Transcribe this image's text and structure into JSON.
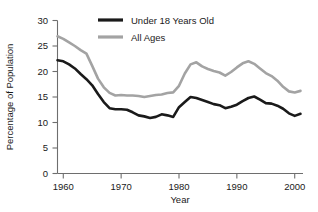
{
  "chart_data": {
    "type": "line",
    "title": "",
    "xlabel": "Year",
    "ylabel": "Percentage of Population",
    "xlim": [
      1959,
      2001
    ],
    "ylim": [
      0,
      30
    ],
    "grid": false,
    "legend_position": "top-center",
    "xticks": [
      "1960",
      "1970",
      "1980",
      "1990",
      "2000"
    ],
    "xtick_values": [
      1960,
      1970,
      1980,
      1990,
      2000
    ],
    "yticks": [
      "0",
      "5",
      "10",
      "15",
      "20",
      "25",
      "30"
    ],
    "ytick_values": [
      0,
      5,
      10,
      15,
      20,
      25,
      30
    ],
    "x": [
      1959,
      1960,
      1961,
      1962,
      1963,
      1964,
      1965,
      1966,
      1967,
      1968,
      1969,
      1970,
      1971,
      1972,
      1973,
      1974,
      1975,
      1976,
      1977,
      1978,
      1979,
      1980,
      1981,
      1982,
      1983,
      1984,
      1985,
      1986,
      1987,
      1988,
      1989,
      1990,
      1991,
      1992,
      1993,
      1994,
      1995,
      1996,
      1997,
      1998,
      1999,
      2000,
      2001
    ],
    "series": [
      {
        "name": "Under 18 Years Old",
        "color": "#1a1a1a",
        "values": [
          22.2,
          22.0,
          21.4,
          20.6,
          19.5,
          18.5,
          17.3,
          15.6,
          14.0,
          12.8,
          12.6,
          12.6,
          12.5,
          12.0,
          11.4,
          11.2,
          10.9,
          11.1,
          11.6,
          11.4,
          11.1,
          13.0,
          14.0,
          15.0,
          14.8,
          14.4,
          14.0,
          13.6,
          13.4,
          12.8,
          13.1,
          13.5,
          14.2,
          14.8,
          15.1,
          14.5,
          13.8,
          13.7,
          13.3,
          12.7,
          11.8,
          11.3,
          11.7
        ]
      },
      {
        "name": "All Ages",
        "color": "#a3a3a3",
        "values": [
          22.4,
          22.2,
          21.9,
          21.0,
          19.5,
          19.0,
          17.3,
          14.7,
          14.2,
          12.8,
          12.2,
          12.6,
          12.5,
          11.9,
          11.1,
          11.2,
          12.3,
          11.8,
          11.6,
          11.4,
          11.7,
          13.0,
          14.0,
          15.0,
          15.2,
          14.4,
          14.0,
          13.6,
          13.4,
          13.0,
          12.8,
          13.5,
          14.2,
          14.5,
          15.1,
          14.5,
          13.8,
          13.7,
          13.3,
          12.7,
          11.9,
          11.3,
          11.7
        ]
      }
    ],
    "under18_values": [
      22.2,
      22.0,
      21.4,
      20.6,
      19.5,
      18.5,
      17.3,
      15.6,
      14.0,
      12.8,
      12.6,
      12.6,
      12.5,
      12.0,
      11.4,
      11.2,
      10.9,
      11.1,
      11.6,
      11.4,
      11.1,
      13.0,
      14.0,
      15.0,
      14.8,
      14.4,
      14.0,
      13.6,
      13.4,
      12.8,
      13.1,
      13.5,
      14.2,
      14.8,
      15.1,
      14.5,
      13.8,
      13.7,
      13.3,
      12.7,
      11.8,
      11.3,
      11.7
    ],
    "all_ages_values": [
      26.9,
      26.4,
      25.7,
      25.0,
      24.2,
      23.5,
      21.1,
      18.6,
      16.9,
      15.8,
      15.3,
      15.4,
      15.3,
      15.3,
      15.2,
      15.0,
      15.2,
      15.4,
      15.5,
      15.8,
      15.9,
      17.2,
      19.6,
      21.4,
      21.8,
      21.0,
      20.5,
      20.1,
      19.8,
      19.2,
      19.9,
      20.8,
      21.6,
      22.0,
      21.5,
      20.6,
      19.7,
      19.1,
      18.2,
      17.0,
      16.1,
      15.9,
      16.2
    ]
  },
  "legend": {
    "entries": [
      {
        "label": "Under 18 Years Old",
        "color": "#1a1a1a",
        "swatch": "thick-line-swatch"
      },
      {
        "label": "All Ages",
        "color": "#a3a3a3",
        "swatch": "thick-line-swatch"
      }
    ]
  },
  "axes": {
    "y_title": "Percentage of Population",
    "x_title": "Year"
  }
}
